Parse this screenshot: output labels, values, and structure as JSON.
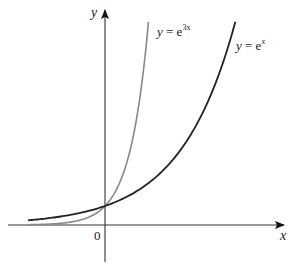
{
  "chart_data": {
    "type": "line",
    "title": "",
    "xlabel": "x",
    "ylabel": "y",
    "origin_label": "0",
    "axes": {
      "x_arrow": true,
      "y_arrow": true,
      "ticks": false,
      "grid": false
    },
    "series": [
      {
        "name": "y = e^x",
        "label_main": "y = e",
        "label_sup": "x",
        "function": "exp(x)",
        "color": "#222222",
        "x_range": [
          -1.4,
          2.37
        ]
      },
      {
        "name": "y = e^{3x}",
        "label_main": "y = e",
        "label_sup": "3x",
        "function": "exp(3x)",
        "color": "#888888",
        "x_range": [
          -1.4,
          0.79
        ]
      }
    ],
    "intersection": {
      "x": 0,
      "y": 1
    }
  }
}
